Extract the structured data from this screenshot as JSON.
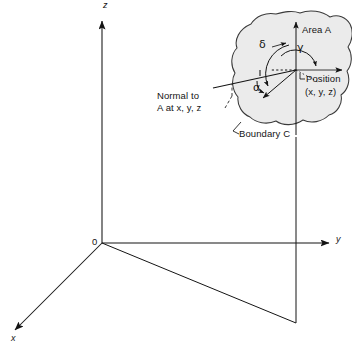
{
  "figure": {
    "background_color": "#ffffff",
    "ink_color": "#141414",
    "surface_fill_color": "#ebebeb",
    "width": 352,
    "height": 351
  },
  "axes": {
    "z_label": "z",
    "y_label": "y",
    "x_label": "x",
    "origin_label": "0"
  },
  "surface": {
    "area_label": "Area A",
    "boundary_label": "Boundary C",
    "position_label": "Position",
    "position_coords": "(x, y, z)",
    "normal_label_line1": "Normal to",
    "normal_label_line2": "A  at  x, y, z"
  },
  "angles": {
    "delta": "δ",
    "gamma": "γ",
    "alpha": "α"
  },
  "icons": {
    "arrowhead": "axis-arrowhead-icon",
    "leader": "leader-line-icon"
  }
}
